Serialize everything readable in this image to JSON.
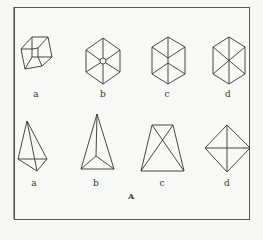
{
  "figure": {
    "caption": "A",
    "top_row": [
      {
        "label": "a",
        "shape": "tilted-wire-cube"
      },
      {
        "label": "b",
        "shape": "hexagon-cube-with-center-point"
      },
      {
        "label": "c",
        "shape": "hexagon-cube-y-edges"
      },
      {
        "label": "d",
        "shape": "hexagon-with-three-diagonals"
      }
    ],
    "bottom_row": [
      {
        "label": "a",
        "shape": "tall-tetrahedron-front-view"
      },
      {
        "label": "b",
        "shape": "tall-tetrahedron-back-view"
      },
      {
        "label": "c",
        "shape": "trapezoid-with-diagonals"
      },
      {
        "label": "d",
        "shape": "diamond-with-cross"
      }
    ],
    "colors": {
      "line": "#333333",
      "frame": "#555555",
      "background": "#f8f8f6"
    }
  }
}
